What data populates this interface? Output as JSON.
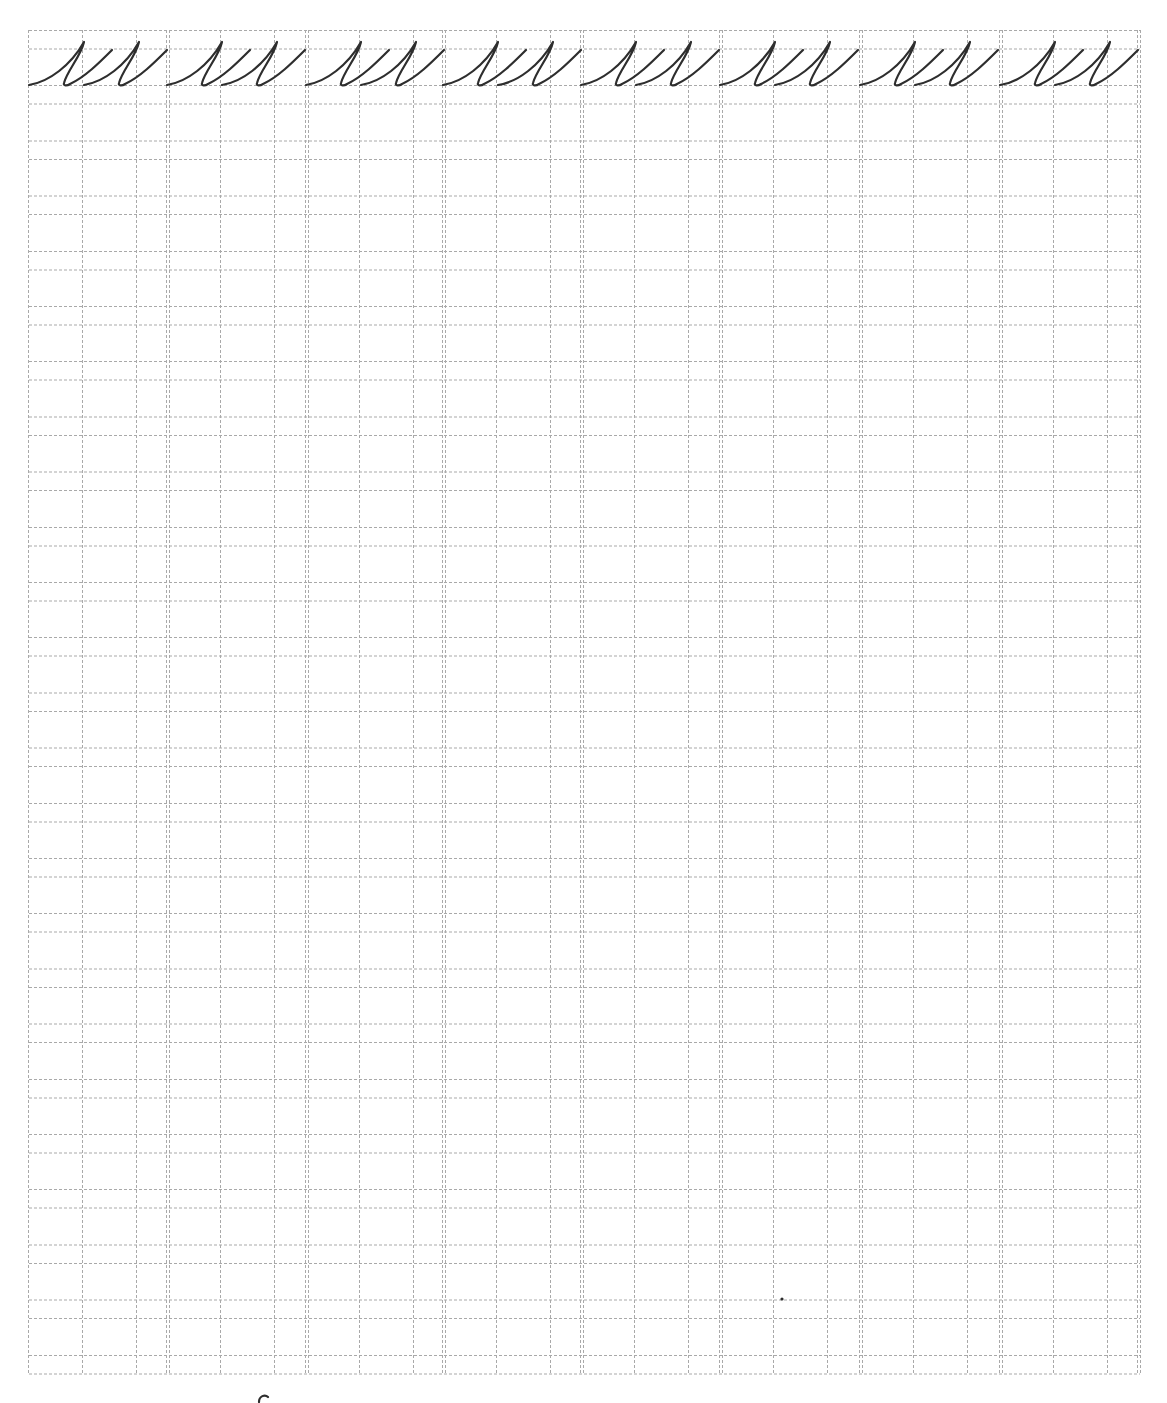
{
  "page": {
    "width": 1167,
    "height": 1403
  },
  "colors": {
    "grid_line": "#a9a9a9",
    "ink": "#2e2e2e",
    "background": "#ffffff"
  },
  "grid": {
    "left": 29,
    "right": 1140,
    "top": 30,
    "bottom": 1374,
    "row_pair_count": 25,
    "row_period": 55.2,
    "row_pair_gap": 18.5,
    "block_count": 8,
    "block_starts": [
      29,
      167,
      306,
      443,
      581,
      720,
      860,
      1000
    ],
    "block_width": 139,
    "inner_column_offsets": [
      53,
      107
    ],
    "double_line_gap": 3
  },
  "practice_row": {
    "glyph_text": "ии",
    "glyph_description": "cursive letter pair (two joined loops) traced on first line",
    "repeat_count": 8,
    "top_line_y": 30,
    "midline_y": 48,
    "baseline_y": 85
  },
  "marks": [
    {
      "name": "stray-dot",
      "x": 782,
      "y": 1299
    },
    {
      "name": "cut-off-glyph-fragment",
      "x": 263,
      "y": 1398
    }
  ]
}
